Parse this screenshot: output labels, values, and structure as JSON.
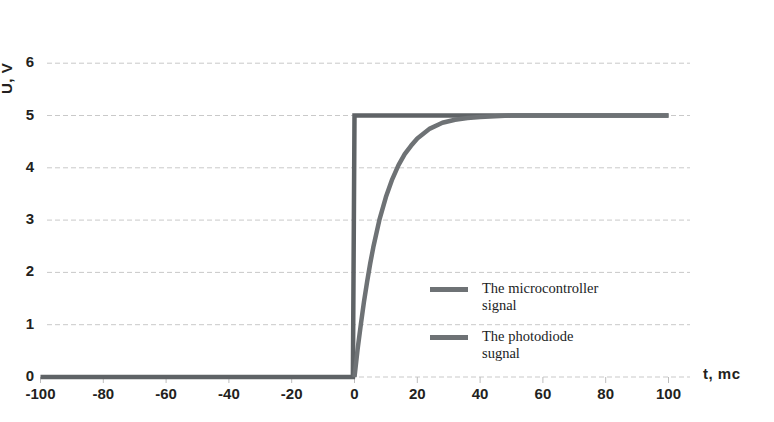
{
  "chart_data": {
    "type": "line",
    "title": "",
    "xlabel": "t, mc",
    "ylabel": "U, V",
    "xlim": [
      -100,
      105
    ],
    "ylim": [
      0,
      6
    ],
    "xticks": [
      -100,
      -80,
      -60,
      -40,
      -20,
      0,
      20,
      40,
      60,
      80,
      100
    ],
    "xtick_labels": [
      "-100",
      "-80",
      "-60",
      "-40",
      "-20",
      "0",
      "20",
      "40",
      "60",
      "80",
      "100"
    ],
    "yticks": [
      0,
      1,
      2,
      3,
      4,
      5,
      6
    ],
    "ytick_labels": [
      "0",
      "1",
      "2",
      "3",
      "4",
      "5",
      "6"
    ],
    "grid": "horizontal-dashed",
    "legend_position": "inside-center-right",
    "series": [
      {
        "name": "The microcontroller\nsignal",
        "color": "#5f6366",
        "type": "step",
        "x": [
          -100,
          -0.5,
          0,
          100
        ],
        "y": [
          0,
          0,
          5,
          5
        ]
      },
      {
        "name": "The photodiode\nsugnal",
        "color": "#6e7275",
        "type": "exponential-rise",
        "tau": 9,
        "amplitude": 5,
        "x": [
          0,
          1,
          2,
          3,
          4,
          5,
          6,
          8,
          10,
          12,
          14,
          16,
          18,
          20,
          24,
          28,
          32,
          36,
          40,
          50,
          60,
          80,
          100
        ],
        "y": [
          0,
          0.53,
          1.0,
          1.43,
          1.82,
          2.17,
          2.48,
          3.02,
          3.44,
          3.78,
          4.05,
          4.26,
          4.42,
          4.56,
          4.75,
          4.86,
          4.92,
          4.95,
          4.97,
          5.0,
          5.0,
          5.0,
          5.0
        ]
      }
    ]
  },
  "axis": {
    "y_title": "U, V",
    "x_title": "t, mc"
  },
  "legend": {
    "items": [
      {
        "label": "The microcontroller\nsignal",
        "color": "#6e7275"
      },
      {
        "label": "The photodiode\nsugnal",
        "color": "#6e7275"
      }
    ]
  }
}
